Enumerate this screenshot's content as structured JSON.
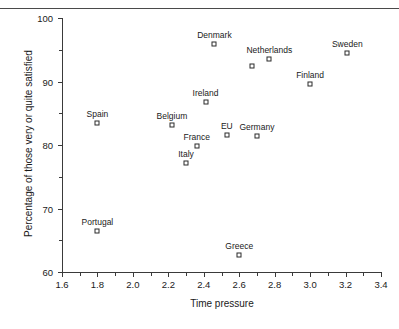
{
  "chart_data": {
    "type": "scatter",
    "title": "",
    "xlabel": "Time pressure",
    "ylabel": "Percentage of those very or quite satisfied",
    "xlim": [
      1.6,
      3.4
    ],
    "ylim": [
      60,
      100
    ],
    "xticks": [
      "1.6",
      "1.8",
      "2.0",
      "2.2",
      "2.4",
      "2.6",
      "2.8",
      "3.0",
      "3.2",
      "3.4"
    ],
    "xtick_values": [
      1.6,
      1.8,
      2.0,
      2.2,
      2.4,
      2.6,
      2.8,
      3.0,
      3.2,
      3.4
    ],
    "yticks": [
      "60",
      "70",
      "80",
      "90",
      "100"
    ],
    "ytick_values": [
      60,
      70,
      80,
      90,
      100
    ],
    "grid": false,
    "legend": "none",
    "marker": "open-square",
    "points": [
      {
        "label": "Portugal",
        "x": 1.8,
        "y": 66.4
      },
      {
        "label": "Spain",
        "x": 1.8,
        "y": 83.4
      },
      {
        "label": "Belgium",
        "x": 2.22,
        "y": 83.1
      },
      {
        "label": "Italy",
        "x": 2.3,
        "y": 77.1
      },
      {
        "label": "France",
        "x": 2.36,
        "y": 79.8
      },
      {
        "label": "Ireland",
        "x": 2.41,
        "y": 86.8
      },
      {
        "label": "Denmark",
        "x": 2.46,
        "y": 95.9
      },
      {
        "label": "EU",
        "x": 2.53,
        "y": 81.6
      },
      {
        "label": "Greece",
        "x": 2.6,
        "y": 62.7
      },
      {
        "label": "Germany",
        "x": 2.7,
        "y": 81.4
      },
      {
        "label": "",
        "x": 2.67,
        "y": 92.5
      },
      {
        "label": "Netherlands",
        "x": 2.77,
        "y": 93.5
      },
      {
        "label": "Finland",
        "x": 3.0,
        "y": 89.6
      },
      {
        "label": "Sweden",
        "x": 3.21,
        "y": 94.5
      }
    ]
  }
}
